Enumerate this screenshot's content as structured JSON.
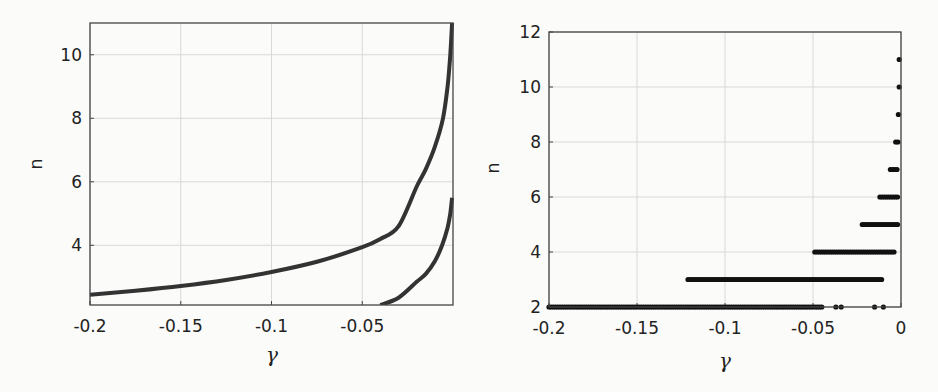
{
  "chart_data": [
    {
      "type": "line",
      "title": "",
      "xlabel": "γ",
      "ylabel": "n",
      "xlim": [
        -0.2,
        0.0
      ],
      "ylim": [
        2.12,
        11.0
      ],
      "xticks": [
        -0.2,
        -0.15,
        -0.1,
        -0.05
      ],
      "xtick_labels": [
        "-0.2",
        "-0.15",
        "-0.1",
        "-0.05"
      ],
      "yticks": [
        4,
        6,
        8,
        10
      ],
      "ytick_labels": [
        "4",
        "6",
        "8",
        "10"
      ],
      "grid": true,
      "legend": null,
      "series": [
        {
          "name": "branch 1",
          "x": [
            -0.2,
            -0.175,
            -0.15,
            -0.125,
            -0.1,
            -0.075,
            -0.05,
            -0.04,
            -0.03,
            -0.02,
            -0.015,
            -0.01,
            -0.0055,
            -0.003,
            -0.0015,
            -0.0005
          ],
          "y": [
            2.44,
            2.57,
            2.72,
            2.91,
            3.16,
            3.48,
            3.94,
            4.2,
            4.6,
            5.85,
            6.4,
            7.1,
            8.0,
            9.0,
            10.0,
            11.0
          ]
        },
        {
          "name": "branch 2",
          "x": [
            -0.04,
            -0.03,
            -0.02,
            -0.015,
            -0.01,
            -0.006,
            -0.003,
            -0.0015,
            -0.0005
          ],
          "y": [
            2.12,
            2.35,
            2.85,
            3.1,
            3.5,
            4.0,
            4.55,
            5.0,
            5.5
          ]
        }
      ]
    },
    {
      "type": "scatter",
      "title": "",
      "xlabel": "γ",
      "ylabel": "n",
      "xlim": [
        -0.2,
        0.0
      ],
      "ylim": [
        2,
        12
      ],
      "xticks": [
        -0.2,
        -0.15,
        -0.1,
        -0.05,
        0
      ],
      "xtick_labels": [
        "-0.2",
        "-0.15",
        "-0.1",
        "-0.05",
        "0"
      ],
      "yticks": [
        2,
        4,
        6,
        8,
        10,
        12
      ],
      "ytick_labels": [
        "2",
        "4",
        "6",
        "8",
        "10",
        "12"
      ],
      "grid": true,
      "legend": null,
      "rows": [
        {
          "n": 2,
          "segments": [
            [
              -0.2,
              -0.045
            ]
          ],
          "isolated": [
            -0.037,
            -0.034,
            -0.015,
            -0.01
          ]
        },
        {
          "n": 3,
          "segments": [
            [
              -0.121,
              -0.011
            ]
          ],
          "isolated": []
        },
        {
          "n": 4,
          "segments": [
            [
              -0.049,
              -0.003
            ]
          ],
          "isolated": []
        },
        {
          "n": 5,
          "segments": [
            [
              -0.022,
              -0.001
            ]
          ],
          "isolated": []
        },
        {
          "n": 6,
          "segments": [
            [
              -0.012,
              -0.001
            ]
          ],
          "isolated": []
        },
        {
          "n": 7,
          "segments": [
            [
              -0.006,
              -0.002
            ]
          ],
          "isolated": []
        },
        {
          "n": 8,
          "segments": [
            [
              -0.003,
              -0.001
            ]
          ],
          "isolated": []
        },
        {
          "n": 9,
          "segments": [],
          "isolated": [
            -0.0015
          ]
        },
        {
          "n": 10,
          "segments": [],
          "isolated": [
            -0.001
          ]
        },
        {
          "n": 11,
          "segments": [],
          "isolated": [
            -0.001
          ]
        }
      ]
    }
  ],
  "colors": {
    "curve": "#333333",
    "markers": "#111111",
    "grid": "#d9d9d9",
    "axes": "#444444"
  }
}
